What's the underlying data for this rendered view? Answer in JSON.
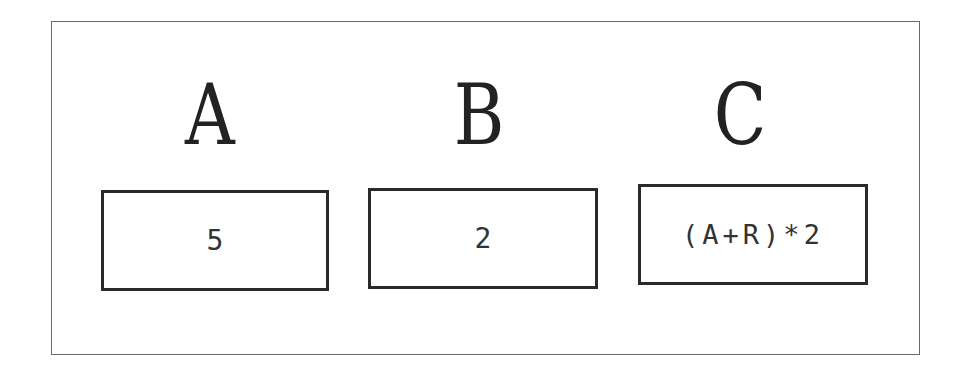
{
  "columns": [
    {
      "header": "A",
      "value": "5"
    },
    {
      "header": "B",
      "value": "2"
    },
    {
      "header": "C",
      "value": "(A+R)*2"
    }
  ]
}
